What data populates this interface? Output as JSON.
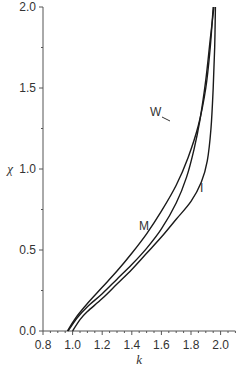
{
  "chart_data": {
    "type": "line",
    "title": "",
    "xlabel": "k",
    "ylabel": "χ",
    "xlim": [
      0.8,
      2.1
    ],
    "ylim": [
      0.0,
      2.0
    ],
    "xticks": [
      "0.8",
      "1.0",
      "1.2",
      "1.4",
      "1.6",
      "1.8",
      "2.0"
    ],
    "yticks": [
      "0.0",
      "0.5",
      "1.0",
      "1.5",
      "2.0"
    ],
    "grid": false,
    "legend": "none (inline curve labels)",
    "series": [
      {
        "name": "M",
        "points": [
          [
            0.965,
            0.0
          ],
          [
            1.02,
            0.08
          ],
          [
            1.1,
            0.17
          ],
          [
            1.2,
            0.27
          ],
          [
            1.3,
            0.37
          ],
          [
            1.4,
            0.48
          ],
          [
            1.5,
            0.6
          ],
          [
            1.6,
            0.74
          ],
          [
            1.7,
            0.9
          ],
          [
            1.78,
            1.07
          ],
          [
            1.85,
            1.27
          ],
          [
            1.9,
            1.5
          ],
          [
            1.93,
            1.75
          ],
          [
            1.95,
            2.0
          ]
        ]
      },
      {
        "name": "W",
        "points": [
          [
            0.97,
            0.0
          ],
          [
            1.03,
            0.08
          ],
          [
            1.1,
            0.15
          ],
          [
            1.2,
            0.23
          ],
          [
            1.3,
            0.32
          ],
          [
            1.4,
            0.41
          ],
          [
            1.5,
            0.51
          ],
          [
            1.6,
            0.63
          ],
          [
            1.7,
            0.79
          ],
          [
            1.77,
            0.95
          ],
          [
            1.82,
            1.12
          ],
          [
            1.86,
            1.3
          ],
          [
            1.9,
            1.55
          ],
          [
            1.93,
            1.8
          ],
          [
            1.955,
            2.0
          ]
        ]
      },
      {
        "name": "I",
        "points": [
          [
            1.0,
            0.0
          ],
          [
            1.05,
            0.07
          ],
          [
            1.1,
            0.12
          ],
          [
            1.2,
            0.2
          ],
          [
            1.3,
            0.29
          ],
          [
            1.4,
            0.38
          ],
          [
            1.5,
            0.48
          ],
          [
            1.6,
            0.58
          ],
          [
            1.7,
            0.69
          ],
          [
            1.8,
            0.8
          ],
          [
            1.87,
            0.92
          ],
          [
            1.91,
            1.05
          ],
          [
            1.935,
            1.25
          ],
          [
            1.95,
            1.5
          ],
          [
            1.96,
            1.75
          ],
          [
            1.965,
            2.0
          ]
        ]
      }
    ],
    "annotations": [
      {
        "text": "W",
        "k": 1.82,
        "chi": 1.35
      },
      {
        "text": "M",
        "k": 1.5,
        "chi": 0.62
      },
      {
        "text": "I",
        "k": 1.88,
        "chi": 0.85
      }
    ]
  }
}
